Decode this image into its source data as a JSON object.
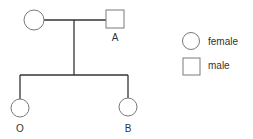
{
  "pedigree": {
    "parents": [
      {
        "id": "mother",
        "sex": "female",
        "label": ""
      },
      {
        "id": "father",
        "sex": "male",
        "label": "A"
      }
    ],
    "children": [
      {
        "id": "child1",
        "sex": "female",
        "label": "O"
      },
      {
        "id": "child2",
        "sex": "female",
        "label": "B"
      }
    ]
  },
  "legend": {
    "items": [
      {
        "shape": "circle",
        "label": "female"
      },
      {
        "shape": "square",
        "label": "male"
      }
    ]
  },
  "colors": {
    "line": "#333333",
    "shape_stroke": "#7a7a7a",
    "background": "#ffffff"
  }
}
